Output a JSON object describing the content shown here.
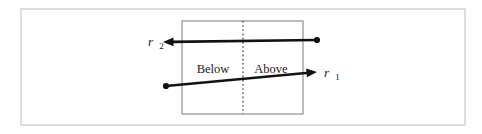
{
  "figure": {
    "background_color": "#ffffff",
    "outer_frame": {
      "name": "outer-frame",
      "x": 21,
      "y": 9,
      "width": 444,
      "height": 116,
      "stroke_color": "#c9c9c9",
      "stroke_width": 1.2
    },
    "inner_box": {
      "name": "inner-box",
      "x": 182,
      "y": 21,
      "width": 121,
      "height": 93,
      "stroke_color": "#8f8f8f",
      "stroke_width": 1.2
    },
    "divider": {
      "name": "vertical-dotted-divider",
      "x": 243,
      "y_top": 21,
      "y_bottom": 114,
      "stroke_color": "#444444",
      "stroke_width": 1.3,
      "dash_pattern": "1.6 2.6"
    },
    "region_labels": [
      {
        "id": "below",
        "text": "Below",
        "x": 213,
        "y": 73,
        "anchor": "middle"
      },
      {
        "id": "above",
        "text": "Above",
        "x": 271,
        "y": 73,
        "anchor": "middle"
      }
    ],
    "rays": [
      {
        "id": "r2",
        "label_base": "r",
        "label_sub": "2",
        "label_x": 148,
        "label_y": 46,
        "label_sub_dx": 6.2,
        "label_sub_dy": 3.4,
        "start_x": 317,
        "start_y": 40,
        "end_x": 163,
        "end_y": 42,
        "dot_x": 317,
        "dot_y": 40,
        "dot_r": 3.1,
        "stroke_color": "#121212",
        "stroke_width": 2.6,
        "arrow_at": "end",
        "direction": "leftward"
      },
      {
        "id": "r1",
        "label_base": "r",
        "label_sub": "1",
        "label_x": 324,
        "label_y": 77,
        "label_sub_dx": 6.2,
        "label_sub_dy": 3.4,
        "start_x": 166,
        "start_y": 86,
        "end_x": 317,
        "end_y": 72,
        "dot_x": 166,
        "dot_y": 86,
        "dot_r": 3.1,
        "stroke_color": "#121212",
        "stroke_width": 2.6,
        "arrow_at": "end",
        "direction": "rightward"
      }
    ]
  }
}
